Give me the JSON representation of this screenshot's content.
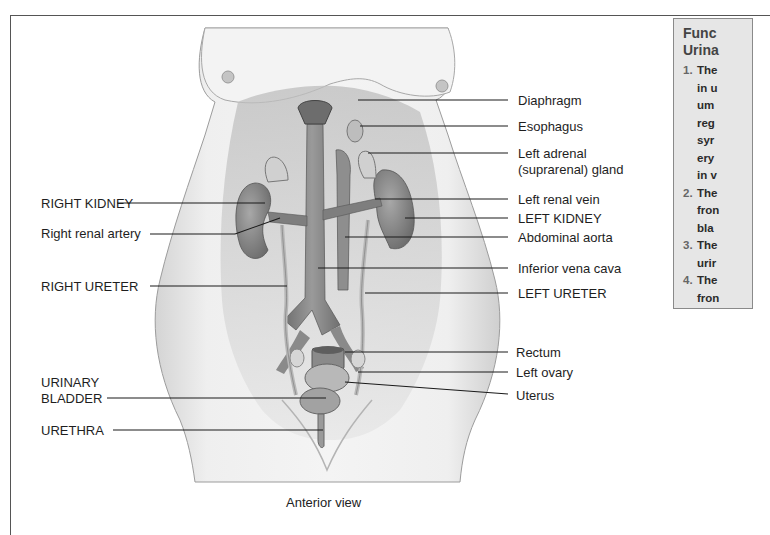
{
  "figure": {
    "caption": "Anterior view",
    "view": "anterior",
    "colors": {
      "background": "#ffffff",
      "skin": "#ececec",
      "organ_dark": "#7a7a7a",
      "organ_mid": "#9a9a9a",
      "vessel": "#8c8c8c",
      "leader_line": "#1a1a1a",
      "panel_bg": "#e6e6e6"
    }
  },
  "labels_left": [
    {
      "id": "right-kidney",
      "text": "RIGHT KIDNEY"
    },
    {
      "id": "right-renal-artery",
      "text": "Right renal artery"
    },
    {
      "id": "right-ureter",
      "text": "RIGHT URETER"
    },
    {
      "id": "urinary-bladder",
      "text": "URINARY\nBLADDER",
      "line1": "URINARY",
      "line2": "BLADDER"
    },
    {
      "id": "urethra",
      "text": "URETHRA"
    }
  ],
  "labels_right": [
    {
      "id": "diaphragm",
      "text": "Diaphragm"
    },
    {
      "id": "esophagus",
      "text": "Esophagus"
    },
    {
      "id": "left-adrenal-gland",
      "text": "Left adrenal (suprarenal) gland",
      "line1": "Left adrenal",
      "line2": "(suprarenal) gland"
    },
    {
      "id": "left-renal-vein",
      "text": "Left renal vein"
    },
    {
      "id": "left-kidney",
      "text": "LEFT KIDNEY"
    },
    {
      "id": "abdominal-aorta",
      "text": "Abdominal aorta"
    },
    {
      "id": "inferior-vena-cava",
      "text": "Inferior vena cava"
    },
    {
      "id": "left-ureter",
      "text": "LEFT URETER"
    },
    {
      "id": "rectum",
      "text": "Rectum"
    },
    {
      "id": "left-ovary",
      "text": "Left ovary"
    },
    {
      "id": "uterus",
      "text": "Uterus"
    }
  ],
  "side_panel": {
    "title_line1": "Func",
    "title_line2": "Urina",
    "items": [
      {
        "num": "1.",
        "lines": [
          "The",
          "in u",
          "um",
          "reg",
          "syr",
          "ery",
          "in v"
        ]
      },
      {
        "num": "2.",
        "lines": [
          "The",
          "fron",
          "bla"
        ]
      },
      {
        "num": "3.",
        "lines": [
          "The",
          "urir"
        ]
      },
      {
        "num": "4.",
        "lines": [
          "The",
          "fron"
        ]
      }
    ]
  }
}
